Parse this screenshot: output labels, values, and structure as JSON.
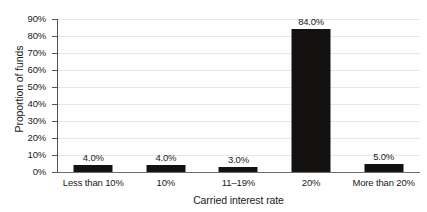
{
  "chart_data": {
    "type": "bar",
    "title": "",
    "xlabel": "Carried interest rate",
    "ylabel": "Proportion of funds",
    "categories": [
      "Less than 10%",
      "10%",
      "11–19%",
      "20%",
      "More than 20%"
    ],
    "values": [
      4.0,
      4.0,
      3.0,
      84.0,
      5.0
    ],
    "data_labels": [
      "4.0%",
      "4.0%",
      "3.0%",
      "84.0%",
      "5.0%"
    ],
    "ylim": [
      0,
      90
    ],
    "ytick_labels": [
      "0%",
      "10%",
      "20%",
      "30%",
      "40%",
      "50%",
      "60%",
      "70%",
      "80%",
      "90%"
    ],
    "ytick_values": [
      0,
      10,
      20,
      30,
      40,
      50,
      60,
      70,
      80,
      90
    ],
    "grid": true,
    "grid_axis": "y",
    "legend": false,
    "bar_color": "#141210",
    "gridline_color": "#e9e7e2",
    "axis_color": "#555250",
    "background_color": "#ffffff"
  }
}
